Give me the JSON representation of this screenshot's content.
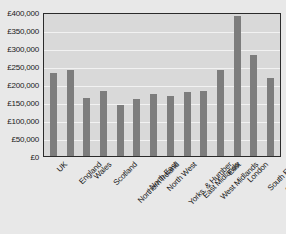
{
  "chart_data": {
    "type": "bar",
    "title": "",
    "xlabel": "",
    "ylabel": "",
    "ylim": [
      0,
      400000
    ],
    "grid": true,
    "legend": "none",
    "y_ticks": [
      "£400,000",
      "£350,000",
      "£300,000",
      "£250,000",
      "£200,000",
      "£150,000",
      "£100,000",
      "£50,000",
      "£0"
    ],
    "y_tick_values": [
      400000,
      350000,
      300000,
      250000,
      200000,
      150000,
      100000,
      50000,
      0
    ],
    "categories": [
      "UK",
      "England",
      "Wales",
      "Scotland",
      "Northern Ireland",
      "North East",
      "North West",
      "Yorks. & Humber",
      "East Midlands",
      "West Midlands",
      "East",
      "London",
      "South East",
      "South West"
    ],
    "values": [
      230000,
      238000,
      160000,
      180000,
      143000,
      158000,
      172000,
      168000,
      178000,
      180000,
      240000,
      390000,
      282000,
      218000
    ]
  },
  "colors": {
    "bar": "#7d7d7d",
    "plot_background": "#d9d9d9",
    "page_background": "#e8e8e8",
    "gridline": "#f2f2f2",
    "axis_border": "#2b2b2b",
    "text": "#1a1a1a"
  }
}
